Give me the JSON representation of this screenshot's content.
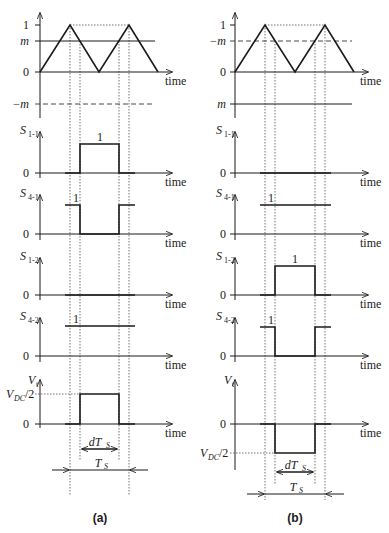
{
  "panels": [
    {
      "id": "a",
      "caption": "(a)",
      "carrier": {
        "levels": {
          "one": "1",
          "m": "m",
          "zero": "0",
          "neg_m": "−m"
        },
        "m_line": "solid",
        "neg_m_line": "dashed"
      },
      "axis_label": "time",
      "signals": [
        {
          "name": "S",
          "sub": "1-1",
          "high_label": "1",
          "waveform": "pulse-high-during-dTs"
        },
        {
          "name": "S",
          "sub": "4-1",
          "high_label": "1",
          "waveform": "pulse-low-during-dTs"
        },
        {
          "name": "S",
          "sub": "1-2",
          "high_label": "",
          "waveform": "constant-0"
        },
        {
          "name": "S",
          "sub": "4-2",
          "high_label": "1",
          "waveform": "constant-1"
        },
        {
          "name": "V",
          "sub": "t",
          "level_label": "V_DC/2",
          "waveform": "positive-pulse"
        }
      ],
      "zero_label": "0",
      "vdc_main": "V",
      "vdc_sub": "DC",
      "vdc_tail": "/2",
      "dTs": "dT",
      "dTs_sub": "S",
      "Ts": "T",
      "Ts_sub": "S"
    },
    {
      "id": "b",
      "caption": "(b)",
      "carrier": {
        "levels": {
          "one": "1",
          "neg_m": "−m",
          "zero": "0",
          "m": "m"
        },
        "neg_m_line": "dashed",
        "m_line": "solid"
      },
      "axis_label": "time",
      "signals": [
        {
          "name": "S",
          "sub": "1-1",
          "high_label": "",
          "waveform": "constant-0"
        },
        {
          "name": "S",
          "sub": "4-1",
          "high_label": "1",
          "waveform": "constant-1"
        },
        {
          "name": "S",
          "sub": "1-2",
          "high_label": "1",
          "waveform": "pulse-high-during-dTs"
        },
        {
          "name": "S",
          "sub": "4-2",
          "high_label": "1",
          "waveform": "pulse-low-during-dTs"
        },
        {
          "name": "V",
          "sub": "t",
          "level_label": "V_DC/2",
          "waveform": "negative-pulse"
        }
      ],
      "zero_label": "0",
      "vdc_main": "V",
      "vdc_sub": "DC",
      "vdc_tail": "/2",
      "dTs": "dT",
      "dTs_sub": "S",
      "Ts": "T",
      "Ts_sub": "S"
    }
  ]
}
